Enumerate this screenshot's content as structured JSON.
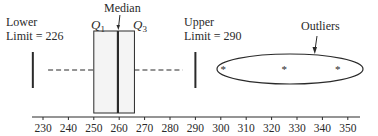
{
  "chart_data": {
    "type": "boxplot",
    "title": "",
    "xlabel": "",
    "ylabel": "",
    "xlim": [
      226,
      356
    ],
    "x_ticks": [
      230,
      240,
      250,
      260,
      270,
      280,
      290,
      300,
      310,
      320,
      330,
      340,
      350
    ],
    "grid": false,
    "box": {
      "q1": 250,
      "median": 259.5,
      "q3": 266
    },
    "whiskers": {
      "low": 232,
      "high": 285
    },
    "limits": {
      "lower": 226,
      "upper": 290
    },
    "outliers": [
      301,
      325,
      346
    ],
    "annotations": [
      {
        "text": "Lower",
        "line2": "Limit = 226",
        "target": "lower limit bar"
      },
      {
        "text": "Upper",
        "line2": "Limit = 290",
        "target": "upper limit bar"
      },
      {
        "text": "Median",
        "target": "median line",
        "arrow": true
      },
      {
        "text": "Q",
        "subscript": "1",
        "target": "left edge of box"
      },
      {
        "text": "Q",
        "subscript": "3",
        "target": "right edge of box"
      },
      {
        "text": "Outliers",
        "target": "ellipse around outliers",
        "arrow": true
      }
    ]
  },
  "labels": {
    "lower_line1": "Lower",
    "lower_line2": "Limit = 226",
    "upper_line1": "Upper",
    "upper_line2": "Limit = 290",
    "median": "Median",
    "q1_main": "Q",
    "q1_sub": "1",
    "q3_main": "Q",
    "q3_sub": "3",
    "outliers": "Outliers"
  },
  "colors": {
    "line": "#2a2a2a",
    "box_fill": "#f4f4f4"
  }
}
